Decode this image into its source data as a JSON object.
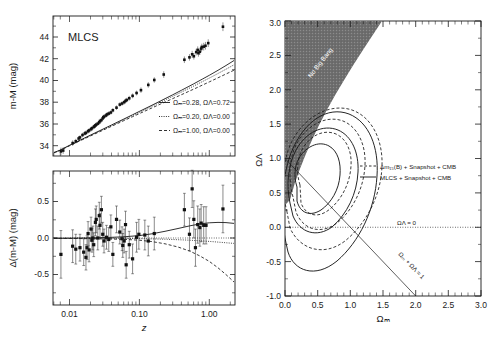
{
  "figure": {
    "background": "#ffffff",
    "ink": "#1a1a1a"
  },
  "left_top_panel": {
    "name": "hubble-diagram",
    "panel_label": "MLCS",
    "ylabel": "m-M (mag)",
    "yticks": [
      "34",
      "36",
      "38",
      "40",
      "42",
      "44"
    ],
    "ylim": [
      32.6,
      45.4
    ],
    "xlim_log": [
      0.0055,
      1.4
    ],
    "legend": [
      {
        "style": "solid",
        "text": "Ωₘ=0.28, ΩΛ=0.72",
        "om": 0.28,
        "ol": 0.72
      },
      {
        "style": "dotted",
        "text": "Ωₘ=0.20, ΩΛ=0.00",
        "om": 0.2,
        "ol": 0.0
      },
      {
        "style": "dashed",
        "text": "Ωₘ=1.00, ΩΛ=0.00",
        "om": 1.0,
        "ol": 0.0
      }
    ]
  },
  "left_bottom_panel": {
    "name": "residual-diagram",
    "ylabel": "Δ(m-M) (mag)",
    "yticks": [
      "0.5",
      "0.0",
      "-0.5"
    ],
    "ylim": [
      -0.85,
      0.95
    ],
    "xlabel": "z",
    "xticks": [
      "0.01",
      "0.10",
      "1.00"
    ],
    "xlim_log": [
      0.0055,
      1.4
    ]
  },
  "right_panel": {
    "name": "omega-contour-plot",
    "xlabel": "Ωₘ",
    "ylabel": "ΩΛ",
    "xticks": [
      "0.0",
      "0.5",
      "1.0",
      "1.5",
      "2.0",
      "2.5",
      "3.0"
    ],
    "yticks": [
      "-1.0",
      "-0.5",
      "0.0",
      "0.5",
      "1.0",
      "1.5",
      "2.0",
      "2.5",
      "3.0"
    ],
    "xlim": [
      0.0,
      3.0
    ],
    "ylim": [
      -1.0,
      3.0
    ],
    "no_big_bang_label": "No Big Bang",
    "annotations": [
      {
        "name": "lambda-zero-line-label",
        "text": "ΩΛ = 0"
      },
      {
        "name": "flat-universe-line-label",
        "text": "Ωₘ + ΩΛ = 1"
      }
    ],
    "legend": [
      {
        "style": "dashed",
        "text": "Δm₁₅(B) + Snapshot + CMB"
      },
      {
        "style": "solid",
        "text": "MLCS + Snapshot + CMB"
      }
    ]
  },
  "chart_data": [
    {
      "type": "scatter",
      "name": "hubble-diagram",
      "title": "MLCS",
      "xlabel": "z",
      "ylabel": "m-M (mag)",
      "xscale": "log",
      "xlim": [
        0.0055,
        1.4
      ],
      "ylim": [
        32.6,
        45.4
      ],
      "xticks": [
        0.01,
        0.1,
        1.0
      ],
      "yticks": [
        34,
        36,
        38,
        40,
        42,
        44
      ],
      "grid": false,
      "points": [
        {
          "z": 0.007,
          "mu": 33.02,
          "err": 0.35
        },
        {
          "z": 0.0075,
          "mu": 33.1,
          "err": 0.3
        },
        {
          "z": 0.01,
          "mu": 33.78,
          "err": 0.25
        },
        {
          "z": 0.011,
          "mu": 33.95,
          "err": 0.22
        },
        {
          "z": 0.012,
          "mu": 34.2,
          "err": 0.22
        },
        {
          "z": 0.0125,
          "mu": 34.3,
          "err": 0.2
        },
        {
          "z": 0.0135,
          "mu": 34.52,
          "err": 0.2
        },
        {
          "z": 0.0145,
          "mu": 34.66,
          "err": 0.2
        },
        {
          "z": 0.015,
          "mu": 34.72,
          "err": 0.2
        },
        {
          "z": 0.016,
          "mu": 34.86,
          "err": 0.2
        },
        {
          "z": 0.0165,
          "mu": 34.94,
          "err": 0.2
        },
        {
          "z": 0.0175,
          "mu": 35.05,
          "err": 0.2
        },
        {
          "z": 0.018,
          "mu": 35.14,
          "err": 0.2
        },
        {
          "z": 0.019,
          "mu": 35.26,
          "err": 0.2
        },
        {
          "z": 0.0195,
          "mu": 35.32,
          "err": 0.2
        },
        {
          "z": 0.02,
          "mu": 35.4,
          "err": 0.2
        },
        {
          "z": 0.0205,
          "mu": 35.46,
          "err": 0.2
        },
        {
          "z": 0.0215,
          "mu": 35.56,
          "err": 0.2
        },
        {
          "z": 0.0225,
          "mu": 35.68,
          "err": 0.2
        },
        {
          "z": 0.023,
          "mu": 35.8,
          "err": 0.2
        },
        {
          "z": 0.024,
          "mu": 35.88,
          "err": 0.2
        },
        {
          "z": 0.025,
          "mu": 36.05,
          "err": 0.2
        },
        {
          "z": 0.0255,
          "mu": 36.14,
          "err": 0.2
        },
        {
          "z": 0.026,
          "mu": 36.2,
          "err": 0.2
        },
        {
          "z": 0.0275,
          "mu": 36.3,
          "err": 0.2
        },
        {
          "z": 0.0285,
          "mu": 36.4,
          "err": 0.2
        },
        {
          "z": 0.03,
          "mu": 36.48,
          "err": 0.2
        },
        {
          "z": 0.032,
          "mu": 36.58,
          "err": 0.2
        },
        {
          "z": 0.034,
          "mu": 36.78,
          "err": 0.2
        },
        {
          "z": 0.038,
          "mu": 37.02,
          "err": 0.2
        },
        {
          "z": 0.042,
          "mu": 37.3,
          "err": 0.2
        },
        {
          "z": 0.045,
          "mu": 37.4,
          "err": 0.2
        },
        {
          "z": 0.048,
          "mu": 37.52,
          "err": 0.2
        },
        {
          "z": 0.05,
          "mu": 37.64,
          "err": 0.2
        },
        {
          "z": 0.052,
          "mu": 37.72,
          "err": 0.2
        },
        {
          "z": 0.056,
          "mu": 37.88,
          "err": 0.22
        },
        {
          "z": 0.062,
          "mu": 38.1,
          "err": 0.22
        },
        {
          "z": 0.07,
          "mu": 38.36,
          "err": 0.22
        },
        {
          "z": 0.08,
          "mu": 38.62,
          "err": 0.25
        },
        {
          "z": 0.1,
          "mu": 39.1,
          "err": 0.25
        },
        {
          "z": 0.12,
          "mu": 39.55,
          "err": 0.25
        },
        {
          "z": 0.16,
          "mu": 40.05,
          "err": 0.3
        },
        {
          "z": 0.3,
          "mu": 41.4,
          "err": 0.3
        },
        {
          "z": 0.35,
          "mu": 41.62,
          "err": 0.3
        },
        {
          "z": 0.38,
          "mu": 41.9,
          "err": 0.32
        },
        {
          "z": 0.4,
          "mu": 41.72,
          "err": 0.3
        },
        {
          "z": 0.43,
          "mu": 42.1,
          "err": 0.3
        },
        {
          "z": 0.45,
          "mu": 42.3,
          "err": 0.32
        },
        {
          "z": 0.46,
          "mu": 42.0,
          "err": 0.32
        },
        {
          "z": 0.48,
          "mu": 42.14,
          "err": 0.3
        },
        {
          "z": 0.5,
          "mu": 42.42,
          "err": 0.32
        },
        {
          "z": 0.51,
          "mu": 42.55,
          "err": 0.32
        },
        {
          "z": 0.54,
          "mu": 42.6,
          "err": 0.35
        },
        {
          "z": 0.57,
          "mu": 42.68,
          "err": 0.35
        },
        {
          "z": 0.62,
          "mu": 42.92,
          "err": 0.35
        },
        {
          "z": 0.97,
          "mu": 44.42,
          "err": 0.4
        }
      ],
      "curves": [
        {
          "name": "Ωₘ=0.28, ΩΛ=0.72",
          "style": "solid"
        },
        {
          "name": "Ωₘ=0.20, ΩΛ=0.00",
          "style": "dotted"
        },
        {
          "name": "Ωₘ=1.00, ΩΛ=0.00",
          "style": "dashed"
        }
      ]
    },
    {
      "type": "scatter",
      "name": "residual-diagram",
      "xlabel": "z",
      "ylabel": "Δ(m-M) (mag)",
      "xscale": "log",
      "xlim": [
        0.0055,
        1.4
      ],
      "ylim": [
        -0.85,
        0.95
      ],
      "xticks": [
        0.01,
        0.1,
        1.0
      ],
      "yticks": [
        -0.5,
        0.0,
        0.5
      ],
      "grid": false,
      "points": [
        {
          "z": 0.007,
          "d": -0.17,
          "err": 0.32
        },
        {
          "z": 0.01,
          "d": -0.06,
          "err": 0.22
        },
        {
          "z": 0.011,
          "d": -0.1,
          "err": 0.2
        },
        {
          "z": 0.0125,
          "d": -0.08,
          "err": 0.18
        },
        {
          "z": 0.014,
          "d": -0.14,
          "err": 0.18
        },
        {
          "z": 0.015,
          "d": -0.21,
          "err": 0.17
        },
        {
          "z": 0.0155,
          "d": -0.08,
          "err": 0.16
        },
        {
          "z": 0.016,
          "d": 0.11,
          "err": 0.16
        },
        {
          "z": 0.0165,
          "d": -0.11,
          "err": 0.16
        },
        {
          "z": 0.0175,
          "d": 0.17,
          "err": 0.16
        },
        {
          "z": 0.018,
          "d": 0.02,
          "err": 0.16
        },
        {
          "z": 0.0185,
          "d": 0.05,
          "err": 0.16
        },
        {
          "z": 0.019,
          "d": -0.04,
          "err": 0.16
        },
        {
          "z": 0.02,
          "d": 0.26,
          "err": 0.18
        },
        {
          "z": 0.0205,
          "d": 0.3,
          "err": 0.18
        },
        {
          "z": 0.0215,
          "d": 0.05,
          "err": 0.16
        },
        {
          "z": 0.0225,
          "d": 0.35,
          "err": 0.18
        },
        {
          "z": 0.023,
          "d": 0.22,
          "err": 0.16
        },
        {
          "z": 0.024,
          "d": 0.43,
          "err": 0.18
        },
        {
          "z": 0.025,
          "d": 0.1,
          "err": 0.16
        },
        {
          "z": 0.026,
          "d": 0.01,
          "err": 0.16
        },
        {
          "z": 0.028,
          "d": 0.06,
          "err": 0.16
        },
        {
          "z": 0.03,
          "d": 0.03,
          "err": 0.16
        },
        {
          "z": 0.032,
          "d": 0.2,
          "err": 0.16
        },
        {
          "z": 0.034,
          "d": -0.17,
          "err": 0.16
        },
        {
          "z": 0.038,
          "d": 0.3,
          "err": 0.18
        },
        {
          "z": 0.042,
          "d": 0.13,
          "err": 0.16
        },
        {
          "z": 0.045,
          "d": 0.04,
          "err": 0.16
        },
        {
          "z": 0.046,
          "d": -0.05,
          "err": 0.16
        },
        {
          "z": 0.048,
          "d": 0.01,
          "err": 0.16
        },
        {
          "z": 0.05,
          "d": 0.23,
          "err": 0.18
        },
        {
          "z": 0.051,
          "d": -0.31,
          "err": 0.18
        },
        {
          "z": 0.056,
          "d": -0.04,
          "err": 0.18
        },
        {
          "z": 0.062,
          "d": -0.23,
          "err": 0.2
        },
        {
          "z": 0.07,
          "d": 0.06,
          "err": 0.2
        },
        {
          "z": 0.075,
          "d": 0.1,
          "err": 0.2
        },
        {
          "z": 0.09,
          "d": 0.09,
          "err": 0.2
        },
        {
          "z": 0.1,
          "d": 0.01,
          "err": 0.2
        },
        {
          "z": 0.12,
          "d": 0.11,
          "err": 0.22
        },
        {
          "z": 0.3,
          "d": 0.43,
          "err": 0.22
        },
        {
          "z": 0.35,
          "d": 0.1,
          "err": 0.22
        },
        {
          "z": 0.38,
          "d": 0.71,
          "err": 0.25
        },
        {
          "z": 0.4,
          "d": 0.3,
          "err": 0.25
        },
        {
          "z": 0.42,
          "d": -0.08,
          "err": 0.25
        },
        {
          "z": 0.45,
          "d": 0.23,
          "err": 0.25
        },
        {
          "z": 0.48,
          "d": 0.19,
          "err": 0.25
        },
        {
          "z": 0.5,
          "d": 0.25,
          "err": 0.25
        },
        {
          "z": 0.54,
          "d": 0.22,
          "err": 0.25
        },
        {
          "z": 0.58,
          "d": 0.22,
          "err": 0.25
        },
        {
          "z": 0.97,
          "d": 0.44,
          "err": 0.32
        }
      ],
      "curves": [
        {
          "name": "Ωₘ=0.28, ΩΛ=0.72",
          "style": "solid"
        },
        {
          "name": "Ωₘ=0.20, ΩΛ=0.00",
          "style": "dotted"
        },
        {
          "name": "Ωₘ=1.00, ΩΛ=0.00",
          "style": "dashed"
        }
      ]
    },
    {
      "type": "line",
      "name": "omega-contour-plot",
      "xlabel": "Ωₘ",
      "ylabel": "ΩΛ",
      "xlim": [
        0.0,
        3.0
      ],
      "ylim": [
        -1.0,
        3.0
      ],
      "xticks": [
        0.0,
        0.5,
        1.0,
        1.5,
        2.0,
        2.5,
        3.0
      ],
      "yticks": [
        -1.0,
        -0.5,
        0.0,
        0.5,
        1.0,
        1.5,
        2.0,
        2.5,
        3.0
      ],
      "grid": false,
      "shaded_region": {
        "label": "No Big Bang",
        "fill": "#6b6b6b"
      },
      "reference_lines": [
        {
          "label": "ΩΛ = 0",
          "style": "dotted",
          "from": [
            0.0,
            0.0
          ],
          "to": [
            3.0,
            0.0
          ]
        },
        {
          "label": "Ωₘ + ΩΛ = 1",
          "style": "solid-thin",
          "from": [
            0.0,
            1.0
          ],
          "to": [
            2.0,
            -1.0
          ]
        }
      ],
      "series": [
        {
          "name": "Δm₁₅(B) + Snapshot + CMB",
          "style": "dashed",
          "levels": [
            "68.3%",
            "95.4%",
            "99.7%"
          ]
        },
        {
          "name": "MLCS + Snapshot + CMB",
          "style": "solid",
          "levels": [
            "68.3%",
            "95.4%",
            "99.7%"
          ]
        }
      ],
      "best_fit_approx": {
        "om": 0.24,
        "ol": 0.72
      }
    }
  ]
}
